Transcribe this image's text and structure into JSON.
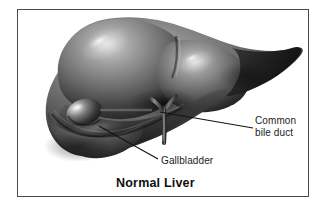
{
  "figure": {
    "caption": "Normal Liver",
    "subject": "liver",
    "style": "grayscale medical illustration",
    "frame_color": "#4a4a4e",
    "background_color": "#ffffff"
  },
  "labels": [
    {
      "id": "gallbladder",
      "text": "Gallbladder",
      "line1": "Gallbladder",
      "line2": "",
      "leader_from": [
        99,
        126
      ],
      "leader_to": [
        158,
        159
      ],
      "color": "#1b1b1b"
    },
    {
      "id": "common-bile-duct",
      "text": "Common bile duct",
      "line1": "Common",
      "line2": "bile duct",
      "leader_from": [
        160,
        112
      ],
      "leader_to": [
        253,
        128
      ],
      "color": "#1b1b1b"
    }
  ],
  "anatomy": {
    "right_lobe": "right lobe",
    "left_lobe": "left lobe",
    "gallbladder": "gallbladder",
    "common_bile_duct": "common bile duct",
    "falciform_notch": "falciform notch"
  },
  "colors": {
    "liver_light": "#b4b4b4",
    "liver_mid": "#7d7d7d",
    "liver_dark": "#2e2e2e",
    "liver_darkest": "#161616",
    "highlight": "#e8e8e8",
    "text": "#1b1b1b",
    "frame": "#4a4a4e"
  }
}
